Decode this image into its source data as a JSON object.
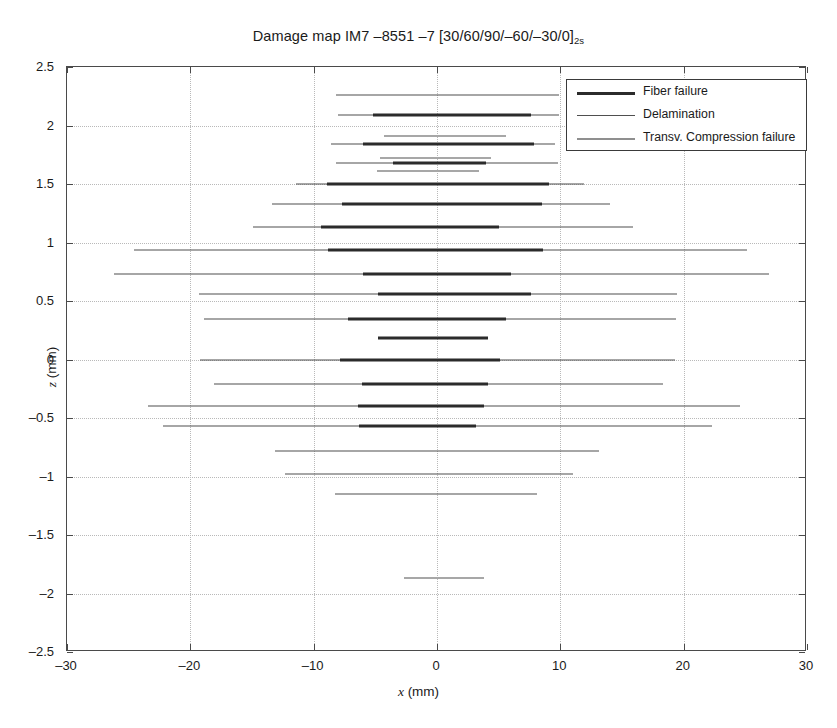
{
  "chart_data": {
    "type": "line",
    "title": "Damage map IM7 –8551 –7 [30/60/90/–60/–30/0]",
    "title_subscript": "2s",
    "xlabel": "x (mm)",
    "ylabel": "z (mm)",
    "xlim": [
      -30,
      30
    ],
    "ylim": [
      -2.5,
      2.5
    ],
    "xticks": [
      -30,
      -20,
      -10,
      0,
      10,
      20,
      30
    ],
    "yticks": [
      2.5,
      2,
      1.5,
      1,
      0.5,
      0,
      -0.5,
      -1,
      -1.5,
      -2,
      -2.5
    ],
    "xtick_labels": [
      "–30",
      "–20",
      "–10",
      "0",
      "10",
      "20",
      "30"
    ],
    "ytick_labels": [
      "2.5",
      "2",
      "1.5",
      "1",
      "0.5",
      "0",
      "–0.5",
      "–1",
      "–1.5",
      "–2",
      "–2.5"
    ],
    "grid": true,
    "legend_position": "top-right",
    "legend": [
      {
        "key": "fiber",
        "label": "Fiber failure",
        "color": "#2b2b2b",
        "width_px": 3.4
      },
      {
        "key": "delam",
        "label": "Delamination",
        "color": "#4f4f4f",
        "width_px": 1.4
      },
      {
        "key": "transv",
        "label": "Transv. Compression failure",
        "color": "#a7a7a7",
        "width_px": 2.1
      }
    ],
    "segments": [
      {
        "type": "delam",
        "z": 2.26,
        "x0": -8.2,
        "x1": 9.9
      },
      {
        "type": "delam",
        "z": 2.09,
        "x0": -8.0,
        "x1": 9.9
      },
      {
        "type": "fiber",
        "z": 2.09,
        "x0": -5.2,
        "x1": 7.6
      },
      {
        "type": "transv",
        "z": 1.91,
        "x0": -4.3,
        "x1": 5.6
      },
      {
        "type": "delam",
        "z": 1.84,
        "x0": -8.6,
        "x1": 9.6
      },
      {
        "type": "fiber",
        "z": 1.84,
        "x0": -6.0,
        "x1": 7.9
      },
      {
        "type": "transv",
        "z": 1.72,
        "x0": -4.6,
        "x1": 4.4
      },
      {
        "type": "delam",
        "z": 1.68,
        "x0": -8.2,
        "x1": 9.8
      },
      {
        "type": "fiber",
        "z": 1.68,
        "x0": -3.6,
        "x1": 4.0
      },
      {
        "type": "transv",
        "z": 1.61,
        "x0": -4.9,
        "x1": 3.4
      },
      {
        "type": "delam",
        "z": 1.5,
        "x0": -11.4,
        "x1": 11.9
      },
      {
        "type": "fiber",
        "z": 1.5,
        "x0": -8.9,
        "x1": 9.1
      },
      {
        "type": "delam",
        "z": 1.33,
        "x0": -13.4,
        "x1": 14.0
      },
      {
        "type": "fiber",
        "z": 1.33,
        "x0": -7.7,
        "x1": 8.5
      },
      {
        "type": "delam",
        "z": 1.13,
        "x0": -14.9,
        "x1": 15.9
      },
      {
        "type": "fiber",
        "z": 1.13,
        "x0": -9.4,
        "x1": 5.0
      },
      {
        "type": "delam",
        "z": 0.94,
        "x0": -24.6,
        "x1": 25.1
      },
      {
        "type": "fiber",
        "z": 0.94,
        "x0": -8.8,
        "x1": 8.6
      },
      {
        "type": "delam",
        "z": 0.73,
        "x0": -26.2,
        "x1": 26.9
      },
      {
        "type": "fiber",
        "z": 0.73,
        "x0": -6.0,
        "x1": 6.0
      },
      {
        "type": "delam",
        "z": 0.56,
        "x0": -19.3,
        "x1": 19.5
      },
      {
        "type": "fiber",
        "z": 0.56,
        "x0": -4.8,
        "x1": 7.6
      },
      {
        "type": "delam",
        "z": 0.35,
        "x0": -18.9,
        "x1": 19.4
      },
      {
        "type": "fiber",
        "z": 0.35,
        "x0": -7.2,
        "x1": 5.6
      },
      {
        "type": "fiber",
        "z": 0.18,
        "x0": -4.8,
        "x1": 4.1
      },
      {
        "type": "delam",
        "z": 0.0,
        "x0": -19.2,
        "x1": 19.3
      },
      {
        "type": "fiber",
        "z": 0.0,
        "x0": -7.9,
        "x1": 5.1
      },
      {
        "type": "delam",
        "z": -0.21,
        "x0": -18.1,
        "x1": 18.3
      },
      {
        "type": "fiber",
        "z": -0.21,
        "x0": -6.1,
        "x1": 4.1
      },
      {
        "type": "delam",
        "z": -0.4,
        "x0": -23.4,
        "x1": 24.6
      },
      {
        "type": "fiber",
        "z": -0.4,
        "x0": -6.4,
        "x1": 3.8
      },
      {
        "type": "delam",
        "z": -0.57,
        "x0": -22.2,
        "x1": 22.3
      },
      {
        "type": "fiber",
        "z": -0.57,
        "x0": -6.3,
        "x1": 3.2
      },
      {
        "type": "delam",
        "z": -0.78,
        "x0": -13.1,
        "x1": 13.1
      },
      {
        "type": "delam",
        "z": -0.98,
        "x0": -12.3,
        "x1": 11.0
      },
      {
        "type": "delam",
        "z": -1.15,
        "x0": -8.3,
        "x1": 8.1
      },
      {
        "type": "transv",
        "z": -1.87,
        "x0": -2.7,
        "x1": 3.8
      }
    ]
  }
}
